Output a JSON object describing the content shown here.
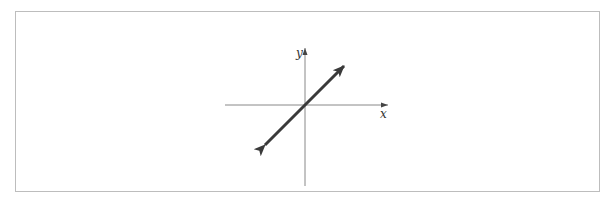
{
  "diagram": {
    "type": "coordinate-plane",
    "axes": {
      "x_label": "x",
      "y_label": "y",
      "origin_px": [
        305,
        105
      ],
      "x_axis_px": [
        225,
        388
      ],
      "y_axis_px": [
        48,
        186
      ]
    },
    "line": {
      "description": "line through origin with positive slope, arrows on both ends",
      "slope": 1,
      "endpoints_px": [
        [
          263,
          147
        ],
        [
          346,
          64
        ]
      ],
      "color": "#3a3a3a"
    },
    "colors": {
      "axis": "#888888",
      "frame": "#bdbdbd",
      "line": "#3a3a3a"
    }
  }
}
